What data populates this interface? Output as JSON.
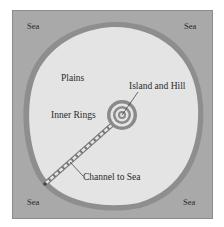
{
  "diagram": {
    "labels": {
      "sea_top_left": "Sea",
      "sea_top_right": "Sea",
      "sea_bottom_left": "Sea",
      "sea_bottom_right": "Sea",
      "plains": "Plains",
      "island_and_hill": "Island and Hill",
      "inner_rings": "Inner Rings",
      "channel_to_sea": "Channel to Sea"
    },
    "colors": {
      "sea": "#a9a9a9",
      "land": "#e4e4e4",
      "shore": "#8e8e8e",
      "rings": "#8a8a8a",
      "frame": "#8c8c8c"
    }
  }
}
